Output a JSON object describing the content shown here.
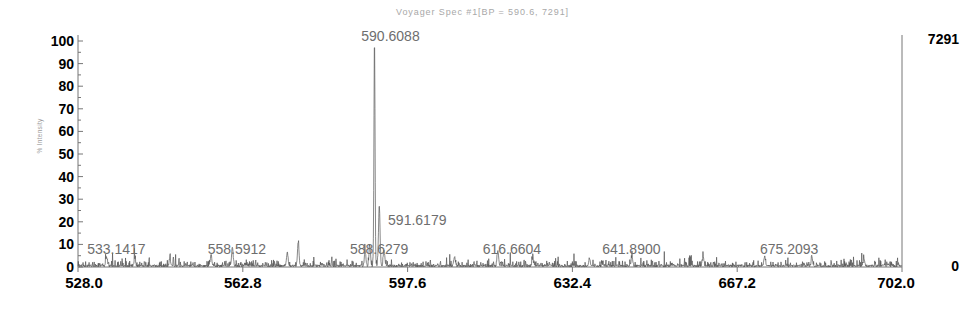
{
  "chart_data": {
    "type": "line",
    "title": "Voyager Spec #1[BP = 590.6, 7291]",
    "subtitle": "",
    "xlabel": "",
    "ylabel": "% Intensity",
    "xlim": [
      528.0,
      702.0
    ],
    "ylim": [
      0,
      100
    ],
    "grid": false,
    "legend": "none",
    "x_ticks": [
      "528.0",
      "562.8",
      "597.6",
      "632.4",
      "667.2",
      "702.0"
    ],
    "x_tick_values": [
      528.0,
      562.8,
      597.6,
      632.4,
      667.2,
      702.0
    ],
    "y_ticks": [
      "0",
      "10",
      "20",
      "30",
      "40",
      "50",
      "60",
      "70",
      "80",
      "90",
      "100"
    ],
    "y_tick_values": [
      0,
      10,
      20,
      30,
      40,
      50,
      60,
      70,
      80,
      90,
      100
    ],
    "right_axis_top_label": "7291",
    "right_axis_bottom_label": "0",
    "right_axis_range": [
      0,
      7291
    ],
    "base_peak_mz": 590.6,
    "base_peak_intensity_counts": 7291,
    "annotations": [
      {
        "label": "533.1417",
        "mz": 533.1417,
        "intensity_pct": 4
      },
      {
        "label": "558.5912",
        "mz": 558.5912,
        "intensity_pct": 8
      },
      {
        "label": "588.6279",
        "mz": 588.6279,
        "intensity_pct": 7
      },
      {
        "label": "590.6088",
        "mz": 590.6088,
        "intensity_pct": 100
      },
      {
        "label": "591.6179",
        "mz": 591.6179,
        "intensity_pct": 27
      },
      {
        "label": "616.6604",
        "mz": 616.6604,
        "intensity_pct": 7
      },
      {
        "label": "641.8900",
        "mz": 641.89,
        "intensity_pct": 5
      },
      {
        "label": "675.2093",
        "mz": 675.2093,
        "intensity_pct": 5
      }
    ],
    "major_peaks": [
      {
        "mz": 590.6088,
        "intensity_pct": 100
      },
      {
        "mz": 591.6179,
        "intensity_pct": 27
      },
      {
        "mz": 589.61,
        "intensity_pct": 9
      },
      {
        "mz": 592.62,
        "intensity_pct": 7
      },
      {
        "mz": 588.6279,
        "intensity_pct": 6.5
      },
      {
        "mz": 574.5,
        "intensity_pct": 10.5
      },
      {
        "mz": 572.2,
        "intensity_pct": 6
      },
      {
        "mz": 560.6,
        "intensity_pct": 8.5
      },
      {
        "mz": 556.1,
        "intensity_pct": 5
      },
      {
        "mz": 534.0,
        "intensity_pct": 4
      },
      {
        "mz": 540.0,
        "intensity_pct": 3.5
      },
      {
        "mz": 547.4,
        "intensity_pct": 3
      },
      {
        "mz": 607.5,
        "intensity_pct": 4
      },
      {
        "mz": 616.6604,
        "intensity_pct": 7
      },
      {
        "mz": 624.0,
        "intensity_pct": 3
      },
      {
        "mz": 636.0,
        "intensity_pct": 3.5
      },
      {
        "mz": 645.0,
        "intensity_pct": 4
      },
      {
        "mz": 660.0,
        "intensity_pct": 4.5
      },
      {
        "mz": 673.0,
        "intensity_pct": 4
      },
      {
        "mz": 683.0,
        "intensity_pct": 3.5
      },
      {
        "mz": 694.0,
        "intensity_pct": 3
      }
    ],
    "baseline_noise_pct": 1.5,
    "colors": {
      "trace": "#555555",
      "axis": "#777777",
      "title_text": "#a8a8a8",
      "tick_text": "#000000",
      "annotation_text": "#6e6e6e",
      "background": "#ffffff"
    }
  },
  "labels": {
    "title": "Voyager Spec #1[BP = 590.6, 7291]",
    "y_axis_title": "% Intensity",
    "right_top": "7291",
    "right_bottom": "0"
  }
}
